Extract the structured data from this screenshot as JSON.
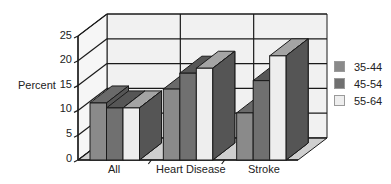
{
  "chart_data": {
    "type": "bar",
    "title": "",
    "xlabel": "",
    "ylabel": "Percent",
    "ylim": [
      0,
      25
    ],
    "yticks": [
      0,
      5,
      10,
      15,
      20,
      25
    ],
    "grid": true,
    "style": "3d-clustered-column",
    "legend_position": "right",
    "categories": [
      "All",
      "Heart Disease",
      "Stroke"
    ],
    "series": [
      {
        "name": "35-44",
        "values": [
          11.5,
          14.3,
          9.5
        ],
        "color": "#8a8a8a"
      },
      {
        "name": "45-54",
        "values": [
          10.5,
          17.5,
          16.0
        ],
        "color": "#707070"
      },
      {
        "name": "55-64",
        "values": [
          10.5,
          18.5,
          21.0
        ],
        "color": "#eeeeee"
      }
    ]
  },
  "labels": {
    "ylabel": "Percent",
    "yticks": [
      "0",
      "5",
      "10",
      "15",
      "20",
      "25"
    ],
    "categories": [
      "All",
      "Heart Disease",
      "Stroke"
    ],
    "legend": [
      "35-44",
      "45-54",
      "55-64"
    ]
  }
}
